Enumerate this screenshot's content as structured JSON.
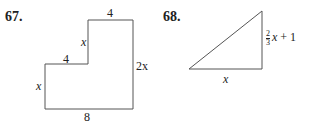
{
  "problems": [
    {
      "number": "67.",
      "shape": "L-shaped polygon",
      "labels": {
        "top": "4",
        "upper_left": "x",
        "step": "4",
        "lower_left": "x",
        "right": "2x",
        "bottom": "8"
      }
    },
    {
      "number": "68.",
      "shape": "right triangle",
      "labels": {
        "base": "x",
        "height_num": "2",
        "height_den": "3",
        "height_var": "x",
        "height_rest": "+ 1"
      }
    }
  ]
}
